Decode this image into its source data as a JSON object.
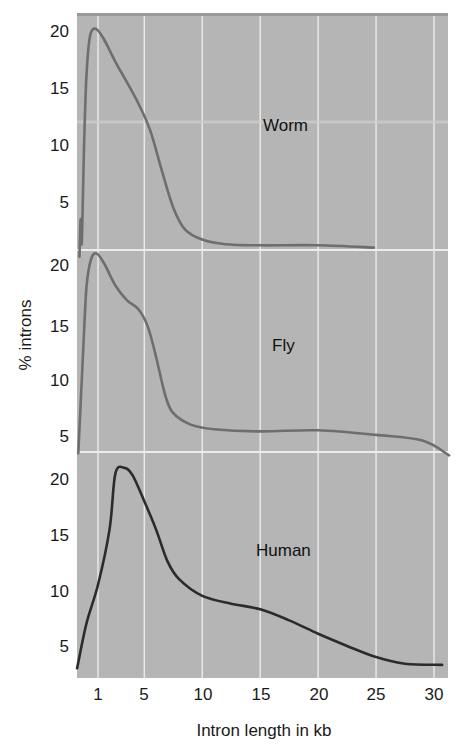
{
  "chart_data": {
    "type": "line",
    "title": "",
    "xlabel": "Intron length in kb",
    "ylabel": "% introns",
    "x_ticks": [
      1,
      5,
      10,
      15,
      20,
      25,
      30
    ],
    "x_range": [
      -0.8,
      31.3
    ],
    "y_ticks": [
      5,
      10,
      15,
      20
    ],
    "grid": true,
    "layout": "three stacked panels sharing x axis",
    "panels": [
      {
        "name": "Worm",
        "ylim": [
          0,
          21
        ],
        "line_color": "#6e6e6e",
        "points": [
          [
            -0.6,
            0.2
          ],
          [
            -0.5,
            3.5
          ],
          [
            -0.4,
            1.5
          ],
          [
            -0.2,
            10
          ],
          [
            0,
            16
          ],
          [
            0.3,
            19.5
          ],
          [
            0.8,
            20.2
          ],
          [
            1.5,
            19.3
          ],
          [
            2.5,
            17.3
          ],
          [
            3.5,
            15.5
          ],
          [
            4.5,
            13.6
          ],
          [
            5.5,
            11.3
          ],
          [
            6.5,
            7.8
          ],
          [
            7.5,
            4.5
          ],
          [
            8.5,
            2.6
          ],
          [
            10,
            1.7
          ],
          [
            12,
            1.3
          ],
          [
            15,
            1.2
          ],
          [
            20,
            1.2
          ],
          [
            24.8,
            1.0
          ]
        ]
      },
      {
        "name": "Fly",
        "ylim": [
          3,
          21
        ],
        "line_color": "#6e6e6e",
        "points": [
          [
            -0.7,
            3.5
          ],
          [
            -0.3,
            12
          ],
          [
            0,
            18
          ],
          [
            0.4,
            20.5
          ],
          [
            0.9,
            21
          ],
          [
            1.6,
            20
          ],
          [
            2.5,
            18.2
          ],
          [
            3.5,
            16.9
          ],
          [
            4.5,
            16.1
          ],
          [
            5.3,
            14.6
          ],
          [
            6,
            12
          ],
          [
            6.8,
            8.6
          ],
          [
            7.5,
            7
          ],
          [
            9,
            6
          ],
          [
            11,
            5.6
          ],
          [
            15,
            5.4
          ],
          [
            20,
            5.5
          ],
          [
            25,
            5.1
          ],
          [
            29,
            4.6
          ],
          [
            31.3,
            3.3
          ]
        ]
      },
      {
        "name": "Human",
        "ylim": [
          3,
          21
        ],
        "line_color": "#2b2b2b",
        "points": [
          [
            -0.8,
            3
          ],
          [
            0,
            7
          ],
          [
            1,
            10.5
          ],
          [
            2,
            15.5
          ],
          [
            2.5,
            20.5
          ],
          [
            3.3,
            21
          ],
          [
            4,
            20.3
          ],
          [
            5,
            18
          ],
          [
            6,
            15.5
          ],
          [
            7,
            12.6
          ],
          [
            8,
            11
          ],
          [
            10,
            9.5
          ],
          [
            12.5,
            8.8
          ],
          [
            15,
            8.3
          ],
          [
            17.5,
            7.3
          ],
          [
            20,
            6.1
          ],
          [
            22.5,
            5
          ],
          [
            25,
            4
          ],
          [
            27.5,
            3.4
          ],
          [
            30.7,
            3.3
          ]
        ]
      }
    ]
  },
  "axes": {
    "x_tick_labels": [
      "1",
      "5",
      "10",
      "15",
      "20",
      "25",
      "30"
    ],
    "y_tick_labels": [
      "20",
      "15",
      "10",
      "5"
    ],
    "xlabel": "Intron length in kb",
    "ylabel": "% introns"
  },
  "panels": {
    "worm": {
      "label": "Worm"
    },
    "fly": {
      "label": "Fly"
    },
    "human": {
      "label": "Human"
    }
  },
  "colors": {
    "plot_background": "#b5b5b5",
    "grid": "#e8e8e8",
    "worm_fly_line": "#6e6e6e",
    "human_line": "#2b2b2b"
  }
}
